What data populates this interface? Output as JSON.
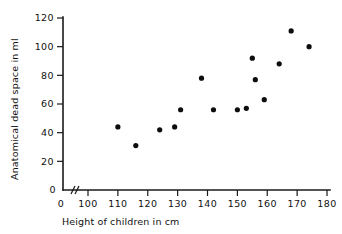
{
  "chart_data": {
    "type": "scatter",
    "title": "",
    "xlabel": "Height of children in cm",
    "ylabel": "Anatomical dead space in ml",
    "xlim": [
      100,
      180
    ],
    "ylim": [
      0,
      120
    ],
    "x_origin_label": "0",
    "y_origin_label": "0",
    "axis_break": true,
    "grid": false,
    "legend": null,
    "xticks": [
      100,
      110,
      120,
      130,
      140,
      150,
      160,
      170,
      180
    ],
    "xtick_labels": [
      "100",
      "110",
      "120",
      "130",
      "140",
      "150",
      "160",
      "170",
      "180"
    ],
    "yticks": [
      0,
      20,
      40,
      60,
      80,
      100,
      120
    ],
    "ytick_labels": [
      "0",
      "20",
      "40",
      "60",
      "80",
      "100",
      "120"
    ],
    "points": [
      {
        "x": 110,
        "y": 44
      },
      {
        "x": 116,
        "y": 31
      },
      {
        "x": 124,
        "y": 42
      },
      {
        "x": 129,
        "y": 44
      },
      {
        "x": 131,
        "y": 56
      },
      {
        "x": 138,
        "y": 78
      },
      {
        "x": 142,
        "y": 56
      },
      {
        "x": 150,
        "y": 56
      },
      {
        "x": 153,
        "y": 57
      },
      {
        "x": 155,
        "y": 92
      },
      {
        "x": 156,
        "y": 77
      },
      {
        "x": 159,
        "y": 63
      },
      {
        "x": 164,
        "y": 88
      },
      {
        "x": 168,
        "y": 111
      },
      {
        "x": 174,
        "y": 100
      }
    ],
    "marker": {
      "shape": "circle",
      "radius": 2.6,
      "color": "#0d0d0d"
    },
    "axis_color": "#1a1a1a"
  }
}
